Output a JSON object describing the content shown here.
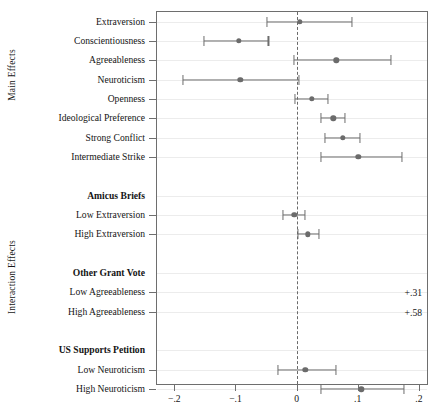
{
  "chart_data": {
    "type": "scatter",
    "title": "",
    "subtitle": "",
    "xlabel": "",
    "ylabel": "",
    "grid": true,
    "legend": false,
    "orientation": "horizontal",
    "xlim": [
      -0.23,
      0.215
    ],
    "xticks": [
      -0.2,
      -0.1,
      0,
      0.1,
      0.2
    ],
    "xtick_labels": [
      "−.2",
      "−.1",
      "0",
      ".1",
      ".2"
    ],
    "reference_line": 0,
    "reference_line_style": "dashed",
    "group_axis_labels": [
      {
        "label": "Main Effects"
      },
      {
        "label": "Interaction Effects"
      }
    ],
    "marker_color": "#6b6b6b",
    "line_color": "#6d6d6d",
    "rows": [
      {
        "label": "Extraversion",
        "kind": "estimate",
        "estimate": 0.005,
        "ci_low": -0.049,
        "ci_high": 0.09
      },
      {
        "label": "Conscientiousness",
        "kind": "estimate",
        "estimate": -0.095,
        "ci_low": -0.152,
        "ci_high": -0.046
      },
      {
        "label": "Agreeableness",
        "kind": "estimate",
        "estimate": 0.065,
        "ci_low": -0.004,
        "ci_high": 0.155
      },
      {
        "label": "Neuroticism",
        "kind": "estimate",
        "estimate": -0.092,
        "ci_low": -0.186,
        "ci_high": 0.004
      },
      {
        "label": "Openness",
        "kind": "estimate",
        "estimate": 0.025,
        "ci_low": -0.003,
        "ci_high": 0.052
      },
      {
        "label": "Ideological Preference",
        "kind": "estimate",
        "estimate": 0.06,
        "ci_low": 0.04,
        "ci_high": 0.079
      },
      {
        "label": "Strong Conflict",
        "kind": "estimate",
        "estimate": 0.076,
        "ci_low": 0.047,
        "ci_high": 0.104
      },
      {
        "label": "Intermediate Strike",
        "kind": "estimate",
        "estimate": 0.101,
        "ci_low": 0.04,
        "ci_high": 0.172
      },
      {
        "label": "",
        "kind": "spacer"
      },
      {
        "label": "Amicus Briefs",
        "kind": "heading"
      },
      {
        "label": "Low Extraversion",
        "kind": "estimate",
        "estimate": -0.004,
        "ci_low": -0.022,
        "ci_high": 0.013
      },
      {
        "label": "High Extraversion",
        "kind": "estimate",
        "estimate": 0.018,
        "ci_low": 0.002,
        "ci_high": 0.036
      },
      {
        "label": "",
        "kind": "spacer"
      },
      {
        "label": "Other Grant Vote",
        "kind": "heading"
      },
      {
        "label": "Low Agreeableness",
        "kind": "offscale",
        "annotation": "+.31"
      },
      {
        "label": "High Agreeableness",
        "kind": "offscale",
        "annotation": "+.58"
      },
      {
        "label": "",
        "kind": "spacer"
      },
      {
        "label": "US Supports Petition",
        "kind": "heading"
      },
      {
        "label": "Low Neuroticism",
        "kind": "estimate",
        "estimate": 0.014,
        "ci_low": -0.03,
        "ci_high": 0.065
      },
      {
        "label": "High Neuroticism",
        "kind": "estimate",
        "estimate": 0.106,
        "ci_low": 0.04,
        "ci_high": 0.176
      }
    ]
  }
}
